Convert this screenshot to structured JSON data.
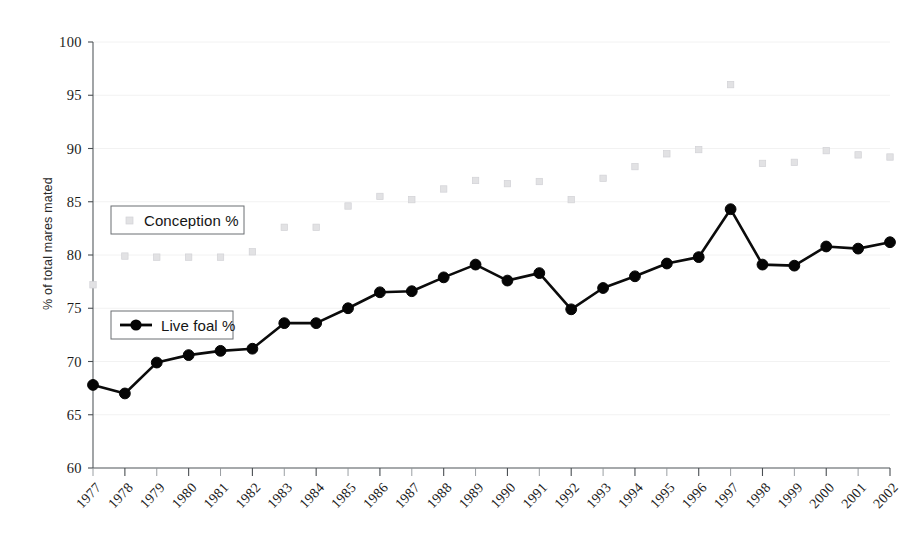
{
  "chart_data": {
    "type": "line",
    "title": "",
    "subtitle": "",
    "xlabel": "",
    "ylabel": "% of total mares mated",
    "ylim": [
      60,
      100
    ],
    "ytick_step": 5,
    "yticks": [
      60,
      65,
      70,
      75,
      80,
      85,
      90,
      95,
      100
    ],
    "grid": false,
    "legend_position": "inside-left",
    "categories": [
      "1977",
      "1978",
      "1979",
      "1980",
      "1981",
      "1982",
      "1983",
      "1984",
      "1985",
      "1986",
      "1987",
      "1988",
      "1989",
      "1990",
      "1991",
      "1992",
      "1993",
      "1994",
      "1995",
      "1996",
      "1997",
      "1998",
      "1999",
      "2000",
      "2001",
      "2002"
    ],
    "series": [
      {
        "name": "Conception %",
        "marker": "faint-square",
        "color": "#e2e2e4",
        "values": [
          77.2,
          79.9,
          79.8,
          79.8,
          79.8,
          80.3,
          82.6,
          82.6,
          84.6,
          85.5,
          85.2,
          86.2,
          87.0,
          86.7,
          86.9,
          85.2,
          87.2,
          88.3,
          89.5,
          89.9,
          96.0,
          88.6,
          88.7,
          89.8,
          89.4,
          89.2
        ]
      },
      {
        "name": "Live foal %",
        "marker": "filled-circle",
        "color": "#050505",
        "values": [
          67.8,
          67.0,
          69.9,
          70.6,
          71.0,
          71.2,
          73.6,
          73.6,
          75.0,
          76.5,
          76.6,
          77.9,
          79.1,
          77.6,
          78.3,
          74.9,
          76.9,
          78.0,
          79.2,
          79.8,
          84.3,
          79.1,
          79.0,
          80.8,
          80.6,
          81.2
        ]
      }
    ]
  },
  "legend": {
    "conception_label": "Conception %",
    "live_foal_label": "Live foal %"
  },
  "axes": {
    "y_title": "% of total mares mated"
  }
}
